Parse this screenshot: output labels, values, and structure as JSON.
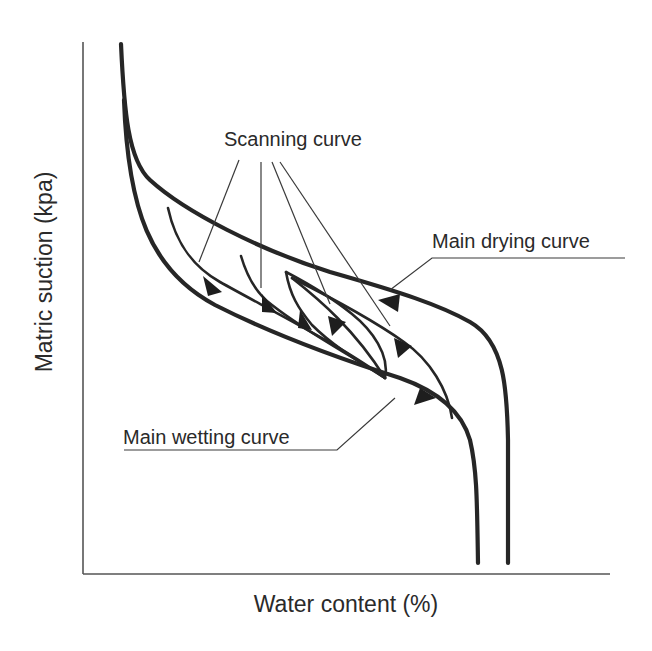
{
  "figure": {
    "type": "soil-water characteristic curve hysteresis diagram",
    "x_axis_label": "Water content (%)",
    "y_axis_label": "Matric suction  (kpa)",
    "annotations": {
      "scanning_curve": "Scanning curve",
      "main_drying_curve": "Main drying curve",
      "main_wetting_curve": "Main wetting curve"
    },
    "curves": [
      {
        "name": "Main drying curve",
        "role": "outer boundary curve",
        "arrow_direction": "toward lower water content (drying)"
      },
      {
        "name": "Main wetting curve",
        "role": "inner boundary curve",
        "arrow_direction": "toward higher water content (wetting)"
      },
      {
        "name": "Scanning curve",
        "count": 5,
        "role": "intermediate paths between main curves"
      }
    ],
    "colors": {
      "curve": "#262626",
      "axis": "#555555",
      "text": "#2a2a2a",
      "background": "#ffffff"
    }
  }
}
